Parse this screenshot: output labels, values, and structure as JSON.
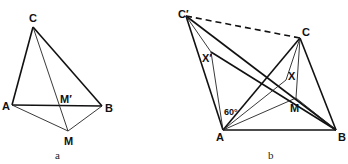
{
  "figure_a": {
    "caption": "a",
    "points": {
      "C": {
        "label": "C",
        "x": 33,
        "y": 27
      },
      "A": {
        "label": "A",
        "x": 12,
        "y": 105
      },
      "B": {
        "label": "B",
        "x": 102,
        "y": 106
      },
      "M_prime": {
        "label": "M′",
        "x": 60,
        "y": 106
      },
      "M": {
        "label": "M",
        "x": 68,
        "y": 131
      }
    }
  },
  "figure_b": {
    "caption": "b",
    "angle_label": "60°",
    "points": {
      "C_prime": {
        "label": "C′",
        "x": 186,
        "y": 16
      },
      "C": {
        "label": "C",
        "x": 300,
        "y": 38
      },
      "X_prime": {
        "label": "X′",
        "x": 211,
        "y": 52
      },
      "X": {
        "label": "X",
        "x": 286,
        "y": 80
      },
      "M": {
        "label": "M",
        "x": 296,
        "y": 98
      },
      "A": {
        "label": "A",
        "x": 223,
        "y": 130
      },
      "B": {
        "label": "B",
        "x": 336,
        "y": 130
      }
    }
  }
}
